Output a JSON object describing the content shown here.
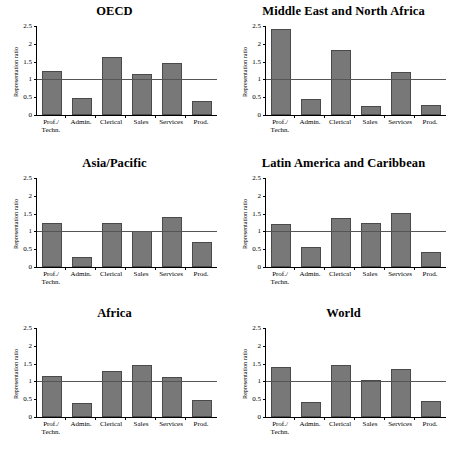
{
  "figure": {
    "categories": [
      "Prof./\nTechn.",
      "Admin.",
      "Clerical",
      "Sales",
      "Services",
      "Prod."
    ],
    "ylabel": "Representation ratio",
    "yticks": [
      "0",
      "0.5",
      "1",
      "1.5",
      "2",
      "2.5"
    ],
    "ytick_values": [
      0,
      0.5,
      1,
      1.5,
      2,
      2.5
    ],
    "ylim": [
      0,
      2.5
    ],
    "reference_line": 1,
    "bar_color": "#787878",
    "bar_border_color": "#4a4a4a",
    "axis_color": "#000000",
    "reference_line_color": "#555555"
  },
  "panels": [
    {
      "title": "OECD",
      "values": [
        1.25,
        0.47,
        1.62,
        1.15,
        1.45,
        0.4
      ]
    },
    {
      "title": "Middle East and North Africa",
      "values": [
        2.42,
        0.44,
        1.83,
        0.26,
        1.22,
        0.29
      ]
    },
    {
      "title": "Asia/Pacific",
      "values": [
        1.24,
        0.29,
        1.24,
        1.0,
        1.41,
        0.71
      ]
    },
    {
      "title": "Latin America and Caribbean",
      "values": [
        1.21,
        0.57,
        1.37,
        1.23,
        1.52,
        0.41
      ]
    },
    {
      "title": "Africa",
      "values": [
        1.15,
        0.38,
        1.3,
        1.47,
        1.12,
        0.49
      ]
    },
    {
      "title": "World",
      "values": [
        1.41,
        0.43,
        1.47,
        1.03,
        1.36,
        0.46
      ]
    }
  ],
  "chart_data": {
    "type": "bar",
    "title": "",
    "xlabel": "",
    "ylabel": "Representation ratio",
    "ylim": [
      0,
      2.5
    ],
    "grid": false,
    "legend": "none",
    "annotations": [
      "horizontal reference line at representation ratio = 1"
    ],
    "categories": [
      "Prof./Techn.",
      "Admin.",
      "Clerical",
      "Sales",
      "Services",
      "Prod."
    ],
    "tick_labels": [
      "0",
      "0.5",
      "1",
      "1.5",
      "2",
      "2.5"
    ],
    "panel_layout": "3 rows x 2 columns of small-multiple bar charts",
    "series": [
      {
        "name": "OECD",
        "values": [
          1.25,
          0.47,
          1.62,
          1.15,
          1.45,
          0.4
        ]
      },
      {
        "name": "Middle East and North Africa",
        "values": [
          2.42,
          0.44,
          1.83,
          0.26,
          1.22,
          0.29
        ]
      },
      {
        "name": "Asia/Pacific",
        "values": [
          1.24,
          0.29,
          1.24,
          1.0,
          1.41,
          0.71
        ]
      },
      {
        "name": "Latin America and Caribbean",
        "values": [
          1.21,
          0.57,
          1.37,
          1.23,
          1.52,
          0.41
        ]
      },
      {
        "name": "Africa",
        "values": [
          1.15,
          0.38,
          1.3,
          1.47,
          1.12,
          0.49
        ]
      },
      {
        "name": "World",
        "values": [
          1.41,
          0.43,
          1.47,
          1.03,
          1.36,
          0.46
        ]
      }
    ]
  }
}
